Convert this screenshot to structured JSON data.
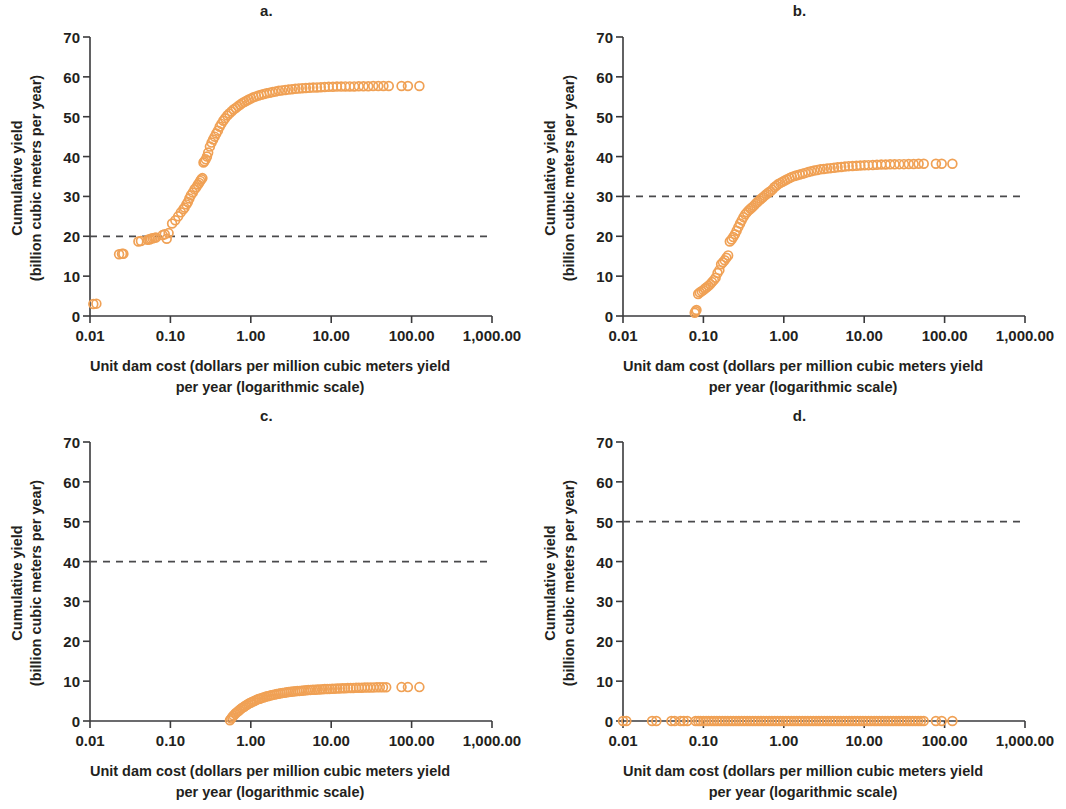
{
  "figure": {
    "panel_count": 4,
    "marker_color": "#F0A155",
    "marker_style": "open-circle",
    "axis_color": "#3a3a3c",
    "threshold_line_color": "#4a4a4c",
    "threshold_line_style": "dashed"
  },
  "labels": {
    "ylabel_line1": "Cumulative yield",
    "ylabel_line2": "(billion cubic meters per year)",
    "xlabel_line1": "Unit dam cost (dollars per million cubic meters yield",
    "xlabel_line2": "per year (logarithmic scale)"
  },
  "axes": {
    "x_ticks": [
      "0.01",
      "0.10",
      "1.00",
      "10.00",
      "100.00",
      "1,000.00"
    ],
    "x_tick_values": [
      0.01,
      0.1,
      1,
      10,
      100,
      1000
    ],
    "y_ticks": [
      "0",
      "10",
      "20",
      "30",
      "40",
      "50",
      "60",
      "70"
    ],
    "y_tick_values": [
      0,
      10,
      20,
      30,
      40,
      50,
      60,
      70
    ],
    "xlim": [
      0.01,
      1000
    ],
    "ylim": [
      0,
      70
    ],
    "xscale": "log",
    "yscale": "linear",
    "grid": false
  },
  "chart_data": [
    {
      "id": "a",
      "type": "scatter",
      "title": "a.",
      "xlabel": "Unit dam cost (dollars per million cubic meters yield per year (logarithmic scale)",
      "ylabel": "Cumulative yield (billion cubic meters per year)",
      "xscale": "log",
      "xlim": [
        0.01,
        1000
      ],
      "ylim": [
        0,
        70
      ],
      "threshold": 20,
      "threshold_label": "",
      "series_name": "cumulative yield",
      "x": [
        0.011,
        0.012,
        0.023,
        0.025,
        0.026,
        0.04,
        0.043,
        0.052,
        0.055,
        0.057,
        0.06,
        0.063,
        0.066,
        0.08,
        0.085,
        0.09,
        0.095,
        0.105,
        0.115,
        0.125,
        0.135,
        0.145,
        0.15,
        0.158,
        0.165,
        0.172,
        0.18,
        0.19,
        0.2,
        0.21,
        0.22,
        0.228,
        0.235,
        0.243,
        0.25,
        0.258,
        0.265,
        0.275,
        0.285,
        0.295,
        0.31,
        0.325,
        0.34,
        0.355,
        0.372,
        0.39,
        0.41,
        0.43,
        0.455,
        0.48,
        0.51,
        0.54,
        0.575,
        0.61,
        0.65,
        0.69,
        0.735,
        0.78,
        0.83,
        0.885,
        0.945,
        1.01,
        1.08,
        1.16,
        1.25,
        1.35,
        1.46,
        1.58,
        1.72,
        1.87,
        2.04,
        2.23,
        2.44,
        2.68,
        2.95,
        3.25,
        3.58,
        3.95,
        4.37,
        4.84,
        5.37,
        5.97,
        6.65,
        7.42,
        8.3,
        9.3,
        10.5,
        11.8,
        13.3,
        15.0,
        17.0,
        19.3,
        22.0,
        25.2,
        28.9,
        33.3,
        38.5,
        44.6,
        52.0,
        75.0,
        90.0,
        125.0
      ],
      "y": [
        3.0,
        3.1,
        15.5,
        15.6,
        15.6,
        18.7,
        18.8,
        19.1,
        19.2,
        19.4,
        19.5,
        19.6,
        19.7,
        20.3,
        20.5,
        19.4,
        20.8,
        23.2,
        24.0,
        25.0,
        26.0,
        26.8,
        27.2,
        28.0,
        28.6,
        29.5,
        30.3,
        31.0,
        31.8,
        32.3,
        33.0,
        33.4,
        33.9,
        34.3,
        34.6,
        38.5,
        38.8,
        39.3,
        40.0,
        41.0,
        42.5,
        43.5,
        44.3,
        45.0,
        45.8,
        46.5,
        47.5,
        48.2,
        49.0,
        49.6,
        50.3,
        50.8,
        51.3,
        51.8,
        52.2,
        52.6,
        53.0,
        53.4,
        53.7,
        54.0,
        54.3,
        54.6,
        54.9,
        55.1,
        55.3,
        55.5,
        55.7,
        55.9,
        56.0,
        56.2,
        56.3,
        56.5,
        56.6,
        56.7,
        56.8,
        56.9,
        57.0,
        57.1,
        57.15,
        57.2,
        57.25,
        57.3,
        57.35,
        57.4,
        57.45,
        57.5,
        57.5,
        57.55,
        57.55,
        57.6,
        57.6,
        57.6,
        57.65,
        57.65,
        57.65,
        57.7,
        57.7,
        57.7,
        57.7,
        57.7,
        57.7,
        57.7
      ]
    },
    {
      "id": "b",
      "type": "scatter",
      "title": "b.",
      "xlabel": "Unit dam cost (dollars per million cubic meters yield per year (logarithmic scale)",
      "ylabel": "Cumulative yield (billion cubic meters per year)",
      "xscale": "log",
      "xlim": [
        0.01,
        1000
      ],
      "ylim": [
        0,
        70
      ],
      "threshold": 30,
      "threshold_label": "",
      "series_name": "cumulative yield",
      "x": [
        0.078,
        0.08,
        0.082,
        0.086,
        0.09,
        0.095,
        0.1,
        0.105,
        0.11,
        0.116,
        0.122,
        0.128,
        0.135,
        0.142,
        0.15,
        0.158,
        0.166,
        0.175,
        0.184,
        0.193,
        0.203,
        0.213,
        0.224,
        0.235,
        0.247,
        0.259,
        0.272,
        0.286,
        0.3,
        0.315,
        0.331,
        0.348,
        0.366,
        0.385,
        0.405,
        0.426,
        0.448,
        0.471,
        0.496,
        0.522,
        0.55,
        0.58,
        0.612,
        0.646,
        0.682,
        0.72,
        0.762,
        0.807,
        0.856,
        0.908,
        0.965,
        1.03,
        1.1,
        1.18,
        1.26,
        1.36,
        1.46,
        1.58,
        1.71,
        1.85,
        2.01,
        2.19,
        2.39,
        2.61,
        2.86,
        3.14,
        3.46,
        3.82,
        4.22,
        4.67,
        5.18,
        5.76,
        6.42,
        7.16,
        8.0,
        8.96,
        10.1,
        11.3,
        12.8,
        14.4,
        16.3,
        18.5,
        21.0,
        23.9,
        27.3,
        31.2,
        35.8,
        41.2,
        47.5,
        55.0,
        78.0,
        92.0,
        125.0
      ],
      "y": [
        0.8,
        1.2,
        1.5,
        5.5,
        5.9,
        6.2,
        6.5,
        6.9,
        7.2,
        7.6,
        8.0,
        8.5,
        9.0,
        9.6,
        10.8,
        11.5,
        13.0,
        13.5,
        14.0,
        14.6,
        15.2,
        18.7,
        19.2,
        19.8,
        20.5,
        21.4,
        22.3,
        23.2,
        24.0,
        24.8,
        25.5,
        26.0,
        26.5,
        26.9,
        27.3,
        27.7,
        28.2,
        28.6,
        29.0,
        29.4,
        29.8,
        30.2,
        30.6,
        31.0,
        31.3,
        31.7,
        32.3,
        32.7,
        33.1,
        33.4,
        33.7,
        34.0,
        34.3,
        34.6,
        34.9,
        35.1,
        35.3,
        35.5,
        35.7,
        35.9,
        36.1,
        36.3,
        36.5,
        36.6,
        36.8,
        36.9,
        37.0,
        37.1,
        37.2,
        37.3,
        37.4,
        37.5,
        37.6,
        37.65,
        37.7,
        37.75,
        37.8,
        37.85,
        37.9,
        37.95,
        38.0,
        38.0,
        38.05,
        38.05,
        38.1,
        38.1,
        38.15,
        38.15,
        38.2,
        38.2,
        38.2,
        38.2,
        38.2
      ]
    },
    {
      "id": "c",
      "type": "scatter",
      "title": "c.",
      "xlabel": "Unit dam cost (dollars per million cubic meters yield per year (logarithmic scale)",
      "ylabel": "Cumulative yield (billion cubic meters per year)",
      "xscale": "log",
      "xlim": [
        0.01,
        1000
      ],
      "ylim": [
        0,
        70
      ],
      "threshold": 40,
      "threshold_label": "",
      "series_name": "cumulative yield",
      "x": [
        0.55,
        0.57,
        0.59,
        0.61,
        0.64,
        0.66,
        0.69,
        0.72,
        0.75,
        0.78,
        0.82,
        0.85,
        0.89,
        0.93,
        0.98,
        1.02,
        1.07,
        1.12,
        1.18,
        1.24,
        1.3,
        1.37,
        1.44,
        1.52,
        1.6,
        1.69,
        1.78,
        1.88,
        1.99,
        2.1,
        2.22,
        2.35,
        2.49,
        2.64,
        2.8,
        2.97,
        3.15,
        3.35,
        3.56,
        3.79,
        4.03,
        4.29,
        4.57,
        4.87,
        5.19,
        5.54,
        5.92,
        6.33,
        6.77,
        7.25,
        7.77,
        8.33,
        8.94,
        9.6,
        10.3,
        11.1,
        11.9,
        12.8,
        13.8,
        14.9,
        16.1,
        17.4,
        18.8,
        20.4,
        22.1,
        24.0,
        26.1,
        28.4,
        31.0,
        33.8,
        36.9,
        40.3,
        44.1,
        48.3,
        75.0,
        90.0,
        125.0
      ],
      "y": [
        0.2,
        0.6,
        1.0,
        1.4,
        1.8,
        2.1,
        2.4,
        2.7,
        3.0,
        3.3,
        3.5,
        3.8,
        4.0,
        4.3,
        4.5,
        4.7,
        4.9,
        5.1,
        5.3,
        5.5,
        5.6,
        5.8,
        5.9,
        6.1,
        6.2,
        6.3,
        6.45,
        6.55,
        6.65,
        6.75,
        6.85,
        6.95,
        7.05,
        7.1,
        7.2,
        7.25,
        7.35,
        7.4,
        7.45,
        7.5,
        7.55,
        7.6,
        7.65,
        7.7,
        7.75,
        7.8,
        7.82,
        7.86,
        7.9,
        7.93,
        7.96,
        8.0,
        8.03,
        8.06,
        8.1,
        8.12,
        8.15,
        8.18,
        8.2,
        8.22,
        8.25,
        8.27,
        8.3,
        8.32,
        8.34,
        8.36,
        8.38,
        8.4,
        8.41,
        8.43,
        8.44,
        8.45,
        8.46,
        8.47,
        8.5,
        8.5,
        8.5
      ]
    },
    {
      "id": "d",
      "type": "scatter",
      "title": "d.",
      "xlabel": "Unit dam cost (dollars per million cubic meters yield per year (logarithmic scale)",
      "ylabel": "Cumulative yield (billion cubic meters per year)",
      "xscale": "log",
      "xlim": [
        0.01,
        1000
      ],
      "ylim": [
        0,
        70
      ],
      "threshold": 50,
      "threshold_label": "",
      "series_name": "cumulative yield",
      "x": [
        0.01,
        0.011,
        0.023,
        0.026,
        0.04,
        0.044,
        0.052,
        0.057,
        0.063,
        0.08,
        0.086,
        0.092,
        0.1,
        0.108,
        0.116,
        0.126,
        0.136,
        0.147,
        0.159,
        0.172,
        0.186,
        0.201,
        0.218,
        0.236,
        0.255,
        0.276,
        0.299,
        0.323,
        0.35,
        0.379,
        0.41,
        0.443,
        0.48,
        0.519,
        0.562,
        0.608,
        0.658,
        0.712,
        0.771,
        0.834,
        0.903,
        0.977,
        1.06,
        1.14,
        1.24,
        1.34,
        1.45,
        1.57,
        1.7,
        1.84,
        1.99,
        2.15,
        2.33,
        2.52,
        2.73,
        2.95,
        3.19,
        3.46,
        3.74,
        4.05,
        4.38,
        4.74,
        5.13,
        5.55,
        6.01,
        6.5,
        7.04,
        7.62,
        8.24,
        8.92,
        9.65,
        10.4,
        11.3,
        12.2,
        13.3,
        14.3,
        15.5,
        16.8,
        18.2,
        19.7,
        21.3,
        23.0,
        24.9,
        27.0,
        29.2,
        31.6,
        34.2,
        37.0,
        40.0,
        43.3,
        46.9,
        50.8,
        55.0,
        78.0,
        92.0,
        125.0
      ],
      "y": [
        0.0,
        0.0,
        0.0,
        0.0,
        0.0,
        0.0,
        0.0,
        0.0,
        0.0,
        0.0,
        0.0,
        0.0,
        0.0,
        0.0,
        0.0,
        0.0,
        0.0,
        0.0,
        0.0,
        0.0,
        0.0,
        0.0,
        0.0,
        0.0,
        0.0,
        0.0,
        0.0,
        0.0,
        0.0,
        0.0,
        0.0,
        0.0,
        0.0,
        0.0,
        0.0,
        0.0,
        0.0,
        0.0,
        0.0,
        0.0,
        0.0,
        0.0,
        0.0,
        0.0,
        0.0,
        0.0,
        0.0,
        0.0,
        0.0,
        0.0,
        0.0,
        0.0,
        0.0,
        0.0,
        0.0,
        0.0,
        0.0,
        0.0,
        0.0,
        0.0,
        0.0,
        0.0,
        0.0,
        0.0,
        0.0,
        0.0,
        0.0,
        0.0,
        0.0,
        0.0,
        0.0,
        0.0,
        0.0,
        0.0,
        0.0,
        0.0,
        0.0,
        0.0,
        0.0,
        0.0,
        0.0,
        0.0,
        0.0,
        0.0,
        0.0,
        0.0,
        0.0,
        0.0,
        0.0,
        0.0,
        0.0,
        0.0,
        0.0,
        0.0,
        0.0,
        0.0
      ]
    }
  ]
}
